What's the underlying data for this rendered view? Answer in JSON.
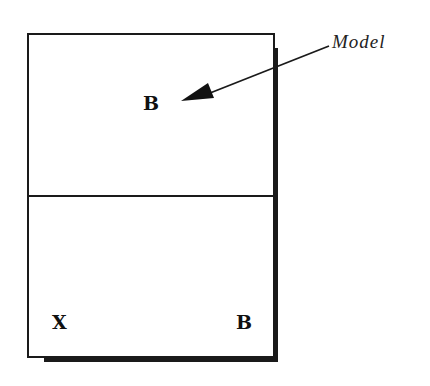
{
  "diagram": {
    "callout_label": "Model",
    "top_region": {
      "letter": "B"
    },
    "bottom_region": {
      "left_letter": "X",
      "right_letter": "B"
    },
    "colors": {
      "line": "#1a1a1a",
      "background": "#ffffff"
    }
  }
}
